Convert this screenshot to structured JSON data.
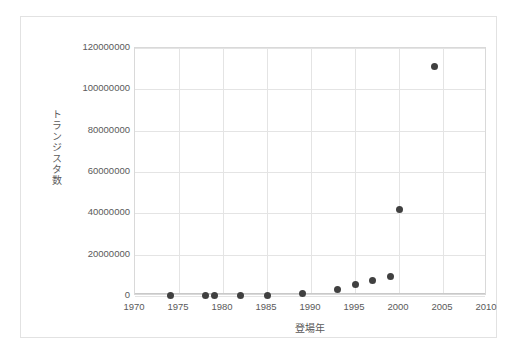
{
  "chart_data": {
    "type": "scatter",
    "title": "",
    "xlabel": "登場年",
    "ylabel": "トランジスタ数",
    "xlim": [
      1970,
      2010
    ],
    "ylim": [
      0,
      120000000
    ],
    "xticks": [
      "1970",
      "1975",
      "1980",
      "1985",
      "1990",
      "1995",
      "2000",
      "2005",
      "2010"
    ],
    "xtick_values": [
      1970,
      1975,
      1980,
      1985,
      1990,
      1995,
      2000,
      2005,
      2010
    ],
    "yticks": [
      "0",
      "20000000",
      "40000000",
      "60000000",
      "80000000",
      "100000000",
      "120000000"
    ],
    "ytick_values": [
      0,
      20000000,
      40000000,
      60000000,
      80000000,
      100000000,
      120000000
    ],
    "grid": true,
    "legend": false,
    "marker_color": "#404040",
    "series": [
      {
        "name": "トランジスタ数",
        "points": [
          {
            "x": 1974,
            "y": 6000
          },
          {
            "x": 1978,
            "y": 29000
          },
          {
            "x": 1979,
            "y": 29000
          },
          {
            "x": 1982,
            "y": 134000
          },
          {
            "x": 1985,
            "y": 275000
          },
          {
            "x": 1989,
            "y": 1180000
          },
          {
            "x": 1993,
            "y": 3100000
          },
          {
            "x": 1995,
            "y": 5500000
          },
          {
            "x": 1997,
            "y": 7500000
          },
          {
            "x": 1999,
            "y": 9500000
          },
          {
            "x": 2000,
            "y": 42000000
          },
          {
            "x": 2004,
            "y": 111000000
          }
        ]
      }
    ]
  },
  "colors": {
    "marker": "#404040",
    "grid": "#e4e4e4",
    "axis": "#d9d9d9",
    "tick_text": "#5a5a5a",
    "frame": "#e2e2e2"
  }
}
